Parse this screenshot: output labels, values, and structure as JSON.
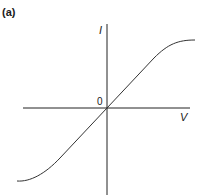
{
  "figure": {
    "panel_label": "(a)",
    "y_axis_label": "I",
    "x_axis_label": "V",
    "origin_label": "0",
    "colors": {
      "line": "#333333",
      "axis": "#222222",
      "background": "#ffffff"
    }
  }
}
